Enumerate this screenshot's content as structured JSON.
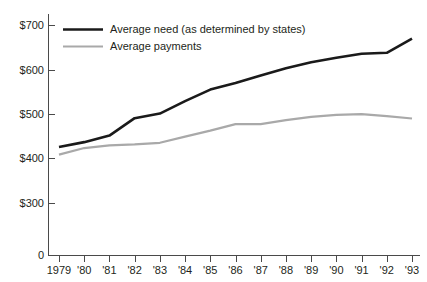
{
  "chart_data": {
    "type": "line",
    "title": "",
    "subtitle": "",
    "xlabel": "",
    "ylabel": "",
    "x": [
      "1979",
      "'80",
      "'81",
      "'82",
      "'83",
      "'84",
      "'85",
      "'86",
      "'87",
      "'88",
      "'89",
      "'90",
      "'91",
      "'92",
      "'93"
    ],
    "categories": [
      "1979",
      "'80",
      "'81",
      "'82",
      "'83",
      "'84",
      "'85",
      "'86",
      "'87",
      "'88",
      "'89",
      "'90",
      "'91",
      "'92",
      "'93"
    ],
    "series": [
      {
        "name": "Average need (as determined by states)",
        "color": "#1a1a1a",
        "line_width": 2.6,
        "values": [
          330,
          345,
          365,
          418,
          432,
          470,
          505,
          525,
          548,
          570,
          588,
          602,
          614,
          617,
          660
        ]
      },
      {
        "name": "Average payments",
        "color": "#a9a9a9",
        "line_width": 2.2,
        "values": [
          307,
          327,
          335,
          338,
          343,
          362,
          380,
          400,
          400,
          412,
          422,
          428,
          430,
          424,
          417
        ]
      }
    ],
    "ylim": [
      0,
      740
    ],
    "yticks": [
      0,
      300,
      400,
      500,
      600,
      700
    ],
    "ytick_labels": [
      "0",
      "$300",
      "$400",
      "$500",
      "$600",
      "$700"
    ],
    "xlim_index": [
      0,
      14
    ],
    "grid": false,
    "legend_position": "top-left",
    "axis_color": "#4a4a4a",
    "background_color": "#ffffff"
  },
  "legend": {
    "entries": [
      {
        "label": "Average need (as determined by states)"
      },
      {
        "label": "Average payments"
      }
    ]
  },
  "axes": {
    "y_axis_name": "dollars",
    "x_axis_name": "year"
  }
}
